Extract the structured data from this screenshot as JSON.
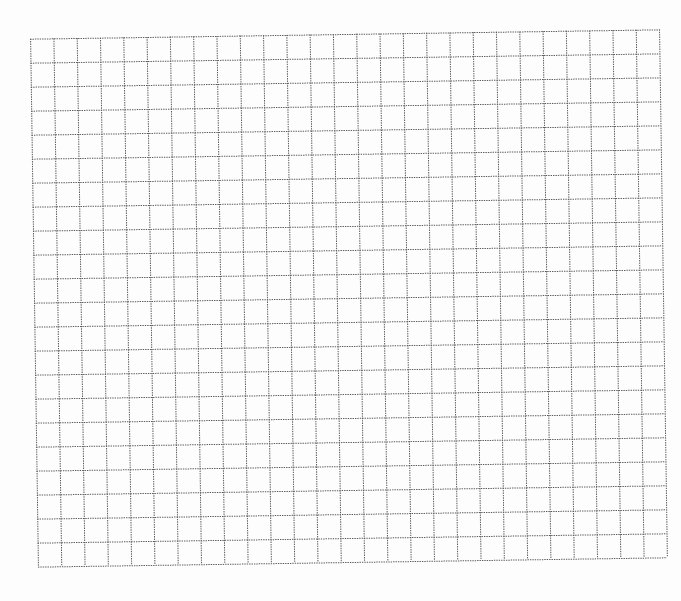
{
  "grid": {
    "columns": 27,
    "rows": 22,
    "width": 629,
    "height": 528,
    "line_color": "#5a5a5a",
    "line_style": "dotted",
    "background": "#ffffff"
  }
}
